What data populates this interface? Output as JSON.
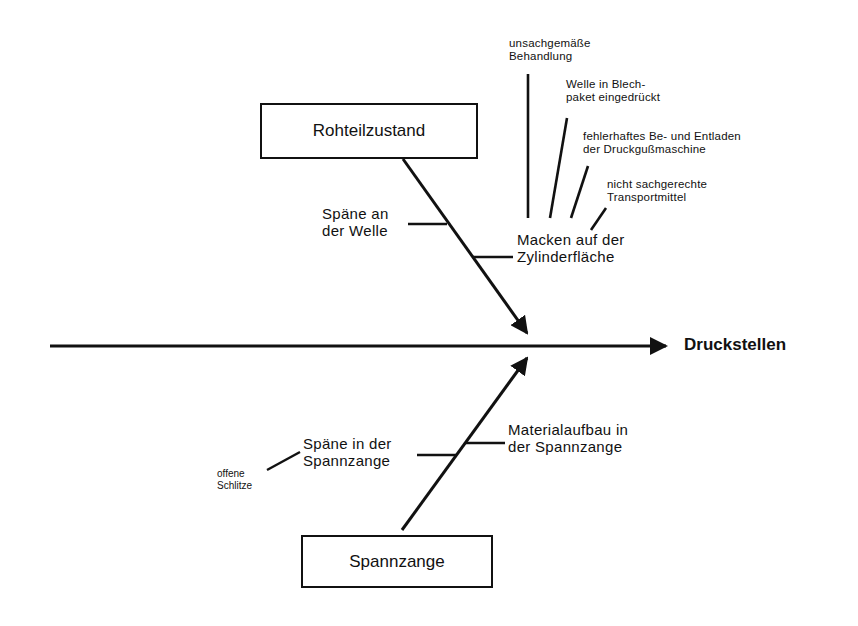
{
  "diagram": {
    "type": "ishikawa-fishbone",
    "effect": "Druckstellen",
    "categories": [
      {
        "label": "Rohteilzustand",
        "position": "top",
        "causes": [
          {
            "label": "Späne an\nder Welle",
            "subcauses": []
          },
          {
            "label": "Macken auf der\nZylinderfläche",
            "subcauses": [
              {
                "label": "unsachgemäße\nBehandlung"
              },
              {
                "label": "Welle in Blech-\npaket eingedrückt"
              },
              {
                "label": "fehlerhaftes Be- und Entladen\nder Druckgußmaschine"
              },
              {
                "label": "nicht sachgerechte\nTransportmittel"
              }
            ]
          }
        ]
      },
      {
        "label": "Spannzange",
        "position": "bottom",
        "causes": [
          {
            "label": "Späne in der\nSpannzange",
            "subcauses": [
              {
                "label": "offene\nSchlitze"
              }
            ]
          },
          {
            "label": "Materialaufbau in\nder Spannzange",
            "subcauses": []
          }
        ]
      }
    ],
    "colors": {
      "line": "#111111",
      "background": "#ffffff"
    }
  }
}
